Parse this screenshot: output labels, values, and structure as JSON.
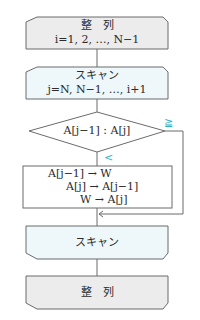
{
  "top_cropped_text": "(リスト・…並び替え…)",
  "flowchart": {
    "loop1_start": {
      "title": "整　列",
      "condition": "i=1, 2, …, N−1"
    },
    "loop2_start": {
      "title": "スキャン",
      "condition": "j=N, N−1, …, i+1"
    },
    "decision": {
      "text": "A[j−1] : A[j]",
      "branch_ge": "≧",
      "branch_lt": "<"
    },
    "process": {
      "line1": "A[j−1] → W",
      "line2": "A[j] → A[j−1]",
      "line3": "W → A[j]"
    },
    "loop2_end": {
      "title": "スキャン"
    },
    "loop1_end": {
      "title": "整　列"
    }
  },
  "colors": {
    "loop_fill": "#eef8fb",
    "outer_fill": "#ececec",
    "stroke": "#6b6b6b",
    "accent": "#2bb3c9"
  }
}
